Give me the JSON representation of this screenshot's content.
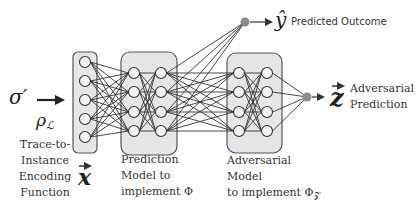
{
  "diagram": {
    "colors": {
      "box_fill": "#e6e6e6",
      "box_stroke": "#555555",
      "edge": "#333333",
      "node_fill": "#f2f2f2",
      "node_stroke": "#333333",
      "output_node": "#8c8c8c",
      "text": "#333333"
    },
    "input": {
      "sigma_label": "σ′",
      "rho_label": "ρ",
      "rho_sub": "ℒ",
      "caption_lines": [
        "Trace-to-",
        "Instance",
        "Encoding",
        "Function"
      ],
      "vector_label": "x",
      "node_count": 5
    },
    "prediction_model": {
      "caption_lines": [
        "Prediction",
        "Model to",
        "implement Φ"
      ],
      "layers": 2,
      "nodes_per_layer": 4
    },
    "adversarial_model": {
      "caption_lines": [
        "Adversarial",
        "Model",
        "to implement Φ"
      ],
      "caption_sub": "𝒵",
      "layers": 2,
      "nodes_per_layer": 4
    },
    "outputs": {
      "predicted": {
        "symbol": "ŷ",
        "label": "Predicted Outcome"
      },
      "adversarial": {
        "symbol": "z",
        "label_lines": [
          "Adversarial",
          "Prediction"
        ]
      }
    }
  }
}
